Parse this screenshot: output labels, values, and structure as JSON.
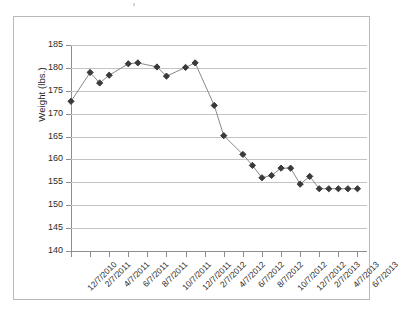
{
  "chart_data": {
    "type": "line",
    "title": "",
    "subtitle": "",
    "xlabel": "",
    "ylabel": "Weight (lbs.)",
    "ylim": [
      140,
      185
    ],
    "y_ticks": [
      140,
      145,
      150,
      155,
      160,
      165,
      170,
      175,
      180,
      185
    ],
    "grid": true,
    "legend": false,
    "legend_position": "none",
    "marker": "diamond",
    "marker_color": "#3a3a3a",
    "line_color": "#8a8a8a",
    "x_tick_labels": [
      "12/7/2010",
      "2/7/2011",
      "4/7/2011",
      "6/7/2011",
      "8/7/2011",
      "10/7/2011",
      "12/7/2011",
      "2/7/2012",
      "4/7/2012",
      "6/7/2012",
      "8/7/2012",
      "10/7/2012",
      "12/7/2012",
      "2/7/2013",
      "4/7/2013",
      "6/7/2013"
    ],
    "x_tick_indices": [
      0,
      2,
      4,
      6,
      8,
      10,
      12,
      14,
      16,
      18,
      20,
      22,
      24,
      26,
      28,
      30
    ],
    "series": [
      {
        "name": "Weight",
        "x": [
          0,
          2,
          3,
          4,
          6,
          7,
          9,
          10,
          12,
          13,
          15,
          16,
          18,
          19,
          20,
          21,
          22,
          23,
          24,
          25,
          26,
          27,
          28,
          29,
          30
        ],
        "values": [
          172.7,
          179.0,
          176.7,
          178.4,
          180.9,
          181.1,
          180.2,
          178.2,
          180.1,
          181.1,
          171.8,
          165.2,
          161.1,
          158.7,
          156.0,
          156.5,
          158.1,
          158.1,
          154.6,
          156.3,
          153.6,
          153.6,
          153.6,
          153.6,
          153.6
        ]
      }
    ],
    "points": [
      {
        "label": "12/7/2010",
        "value": 172.7
      },
      {
        "label": "2/7/2011",
        "value": 179.0
      },
      {
        "label": "3/7/2011",
        "value": 176.7
      },
      {
        "label": "4/7/2011",
        "value": 178.4
      },
      {
        "label": "6/7/2011",
        "value": 180.9
      },
      {
        "label": "7/7/2011",
        "value": 181.1
      },
      {
        "label": "8/7/2011",
        "value": 180.2
      },
      {
        "label": "9/7/2011",
        "value": 178.2
      },
      {
        "label": "10/7/2011",
        "value": 180.1
      },
      {
        "label": "11/7/2011",
        "value": 181.1
      },
      {
        "label": "12/7/2011",
        "value": 171.8
      },
      {
        "label": "1/7/2012",
        "value": 165.2
      },
      {
        "label": "3/7/2012",
        "value": 161.1
      },
      {
        "label": "4/7/2012",
        "value": 158.7
      },
      {
        "label": "5/7/2012",
        "value": 156.0
      },
      {
        "label": "6/7/2012",
        "value": 156.5
      },
      {
        "label": "7/7/2012",
        "value": 158.1
      },
      {
        "label": "9/7/2012",
        "value": 158.1
      },
      {
        "label": "11/7/2012",
        "value": 154.6
      },
      {
        "label": "1/7/2013",
        "value": 156.3
      },
      {
        "label": "3/7/2013",
        "value": 153.6
      }
    ]
  },
  "plot": {
    "x_domain": [
      0,
      31
    ],
    "y_domain": [
      140,
      185
    ]
  }
}
